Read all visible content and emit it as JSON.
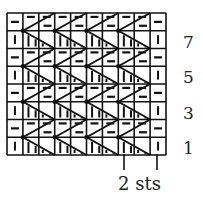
{
  "chart": {
    "type": "knitting-chart",
    "rows": 8,
    "columns": 10,
    "cell_width": 15.9,
    "cell_height": 17.75,
    "origin": [
      7,
      13
    ],
    "edge_stitch_odd": "knit",
    "edge_stitch_even": "purl",
    "repeat": {
      "width_sts": 2,
      "description": "2-stitch twist repeated across 8 center columns"
    },
    "colors": {
      "line": "#111111",
      "background": "#ffffff",
      "text": "#222222"
    }
  },
  "row_labels": [
    {
      "label": "7",
      "row": 7
    },
    {
      "label": "5",
      "row": 5
    },
    {
      "label": "3",
      "row": 3
    },
    {
      "label": "1",
      "row": 1
    }
  ],
  "repeat_label": "2 sts",
  "symbols": {
    "knit": "vertical-bar",
    "purl": "horizontal-dash"
  }
}
